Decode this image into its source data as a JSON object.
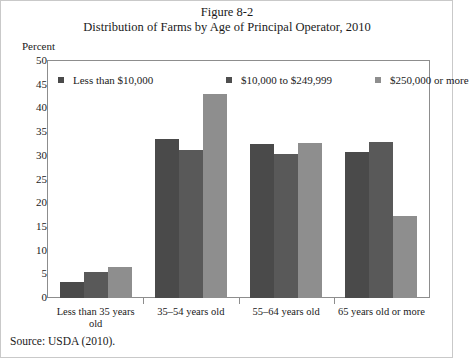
{
  "figure": {
    "caption": "Figure 8-2",
    "title": "Distribution of Farms by Age of Principal Operator, 2010",
    "source": "Source: USDA (2010)."
  },
  "chart_data": {
    "type": "bar",
    "title": "Distribution of Farms by Age of Principal Operator, 2010",
    "xlabel": "",
    "ylabel": "Percent",
    "ylim": [
      0,
      50
    ],
    "yticks": [
      0,
      5,
      10,
      15,
      20,
      25,
      30,
      35,
      40,
      45,
      50
    ],
    "grid": false,
    "legend_position": "top-inside",
    "categories": [
      "Less than 35 years old",
      "35–54 years old",
      "55–64 years old",
      "65 years old or more"
    ],
    "series": [
      {
        "name": "Less than $10,000",
        "color": "#4a4a4a",
        "values": [
          3.3,
          33.5,
          32.4,
          30.8
        ]
      },
      {
        "name": "$10,000 to $249,999",
        "color": "#595959",
        "values": [
          5.4,
          31.2,
          30.3,
          33.0
        ]
      },
      {
        "name": "$250,000 or more",
        "color": "#8e8e8e",
        "values": [
          6.5,
          43.0,
          32.7,
          17.3
        ]
      }
    ]
  },
  "category_label_lines": [
    [
      "Less than 35 years",
      "old"
    ],
    [
      "35–54 years old"
    ],
    [
      "55–64 years old"
    ],
    [
      "65 years old or more"
    ]
  ]
}
